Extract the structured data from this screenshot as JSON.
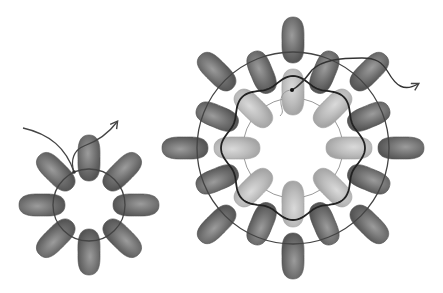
{
  "figure": {
    "width": 443,
    "height": 293,
    "colors": {
      "background": "#ffffff",
      "dark_bead": "#6e6e6e",
      "dark_bead_highlight": "#9a9a9a",
      "dark_bead_edge": "#4e4e4e",
      "light_bead": "#b8b8b8",
      "light_bead_highlight": "#d6d6d6",
      "thread": "#444444",
      "thread_bold": "#222222",
      "thin_thread": "#9a9a9a"
    }
  },
  "small_ring": {
    "center": [
      89,
      205
    ],
    "thread_radius": 36,
    "bead_radius": 47,
    "bead_count": 8,
    "bead_length": 46,
    "bead_width": 22
  },
  "large_ring": {
    "center": [
      293,
      148
    ],
    "inner_thread_radius": 50,
    "inner_beads": {
      "count": 8,
      "radius": 56,
      "length": 46,
      "width": 22,
      "shade": "light"
    },
    "middle_beads": {
      "count": 8,
      "radius": 82,
      "length": 44,
      "width": 22,
      "shade": "dark"
    },
    "outer_beads": {
      "count": 8,
      "radius": 108,
      "length": 46,
      "width": 22,
      "shade": "dark"
    },
    "outer_thread_radius": 96,
    "wavy_thread_radius": 68
  }
}
